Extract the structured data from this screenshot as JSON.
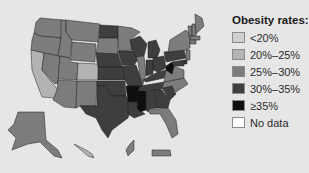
{
  "chart_data": {
    "type": "choropleth",
    "title": "Obesity rates:",
    "legend_position": "right",
    "categories": [
      {
        "key": "lt20",
        "label": "<20%",
        "color": "#cfcfcf"
      },
      {
        "key": "20_25",
        "label": "20%–25%",
        "color": "#b3b3b3"
      },
      {
        "key": "25_30",
        "label": "25%–30%",
        "color": "#7c7c7c"
      },
      {
        "key": "30_35",
        "label": "30%–35%",
        "color": "#3e3e3e"
      },
      {
        "key": "ge35",
        "label": "≥35%",
        "color": "#0f0f0f"
      },
      {
        "key": "nodata",
        "label": "No data",
        "color": "#ffffff"
      }
    ],
    "regions": {
      "WA": "25_30",
      "OR": "25_30",
      "CA": "20_25",
      "NV": "25_30",
      "ID": "25_30",
      "MT": "25_30",
      "WY": "25_30",
      "UT": "25_30",
      "CO": "20_25",
      "AZ": "25_30",
      "NM": "25_30",
      "ND": "30_35",
      "SD": "25_30",
      "NE": "30_35",
      "KS": "30_35",
      "OK": "30_35",
      "TX": "30_35",
      "MN": "25_30",
      "IA": "30_35",
      "MO": "30_35",
      "AR": "ge35",
      "LA": "30_35",
      "WI": "30_35",
      "IL": "25_30",
      "MI": "30_35",
      "IN": "30_35",
      "OH": "30_35",
      "KY": "30_35",
      "TN": "30_35",
      "MS": "ge35",
      "AL": "30_35",
      "GA": "30_35",
      "FL": "25_30",
      "SC": "30_35",
      "NC": "25_30",
      "VA": "25_30",
      "WV": "ge35",
      "PA": "30_35",
      "NY": "25_30",
      "VT": "25_30",
      "NH": "25_30",
      "ME": "25_30",
      "MA": "25_30",
      "CT": "25_30",
      "NJ": "25_30",
      "DE": "30_35",
      "MD": "30_35",
      "AK": "25_30",
      "HI": "20_25",
      "GU": "25_30",
      "PR": "25_30"
    }
  }
}
